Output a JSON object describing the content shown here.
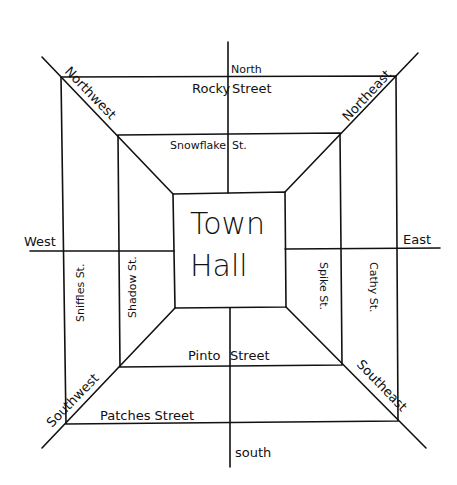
{
  "map": {
    "title": "Town Hall",
    "center_building": {
      "line1": "Town",
      "line2": "Hall"
    },
    "directions": {
      "north": "North",
      "south": "south",
      "east": "East",
      "west": "West",
      "northwest": "Northwest",
      "northeast": "Northeast",
      "southwest": "Southwest",
      "southeast": "Southeast"
    },
    "streets": {
      "rocky": "Rocky",
      "rocky_suffix": "Street",
      "snowflake": "Snowflake",
      "snowflake_suffix": "St.",
      "pinto": "Pinto",
      "pinto_suffix": "Street",
      "patches": "Patches Street",
      "sniffles": "Sniffles St.",
      "shadow": "Shadow St.",
      "spike": "Spike St.",
      "cathy": "Cathy St."
    },
    "colors": {
      "ink": "#111111",
      "paper": "#ffffff"
    }
  }
}
